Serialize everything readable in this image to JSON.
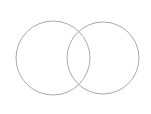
{
  "diagram": {
    "type": "venn",
    "background": "#ffffff",
    "stroke_color": "#a9a9a9",
    "circles": [
      {
        "name": "left",
        "cx": 53,
        "cy": 58,
        "r": 37
      },
      {
        "name": "right",
        "cx": 103,
        "cy": 58,
        "r": 36
      }
    ]
  }
}
